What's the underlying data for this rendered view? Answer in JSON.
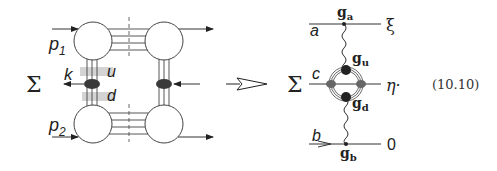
{
  "left_diagram": {
    "sum_symbol": "Σ",
    "labels": {
      "p1": "p",
      "p1_sub": "1",
      "p2": "p",
      "p2_sub": "2",
      "k": "k",
      "u": "u",
      "d": "d"
    }
  },
  "implies_arrow": "⇒",
  "right_diagram": {
    "sum_symbol": "Σ",
    "labels": {
      "a": "a",
      "b": "b",
      "c": "c",
      "xi": "ξ",
      "eta": "η·",
      "zero": "0",
      "g_a": "g",
      "g_a_sub": "a",
      "g_u": "g",
      "g_u_sub": "u",
      "g_d": "g",
      "g_d_sub": "d",
      "g_b": "g",
      "g_b_sub": "b"
    }
  },
  "equation_number": "(10.10)",
  "colors": {
    "line": "#333333",
    "blob": "#444444",
    "shade": "#cccccc"
  }
}
